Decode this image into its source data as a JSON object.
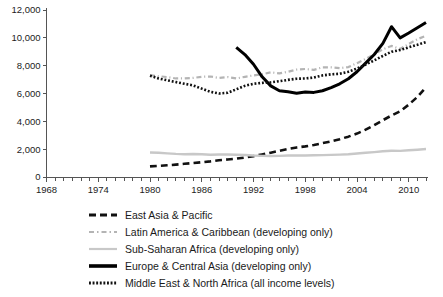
{
  "chart_data": {
    "type": "line",
    "title": "",
    "xlabel": "",
    "ylabel": "",
    "xlim": [
      1968,
      2012
    ],
    "ylim": [
      0,
      12000
    ],
    "grid": false,
    "legend_position": "bottom",
    "x_ticks": [
      1968,
      1974,
      1980,
      1986,
      1992,
      1998,
      2004,
      2010
    ],
    "x_minor_tick_interval": 1,
    "y_ticks": [
      0,
      2000,
      4000,
      6000,
      8000,
      10000,
      12000
    ],
    "y_tick_labels": [
      "0",
      "2,000",
      "4,000",
      "6,000",
      "8,000",
      "10,000",
      "12,000"
    ],
    "series": [
      {
        "name": "East Asia & Pacific",
        "style": "dashed",
        "color": "#111111",
        "width": 2.6,
        "x": [
          1980,
          1981,
          1982,
          1983,
          1984,
          1985,
          1986,
          1987,
          1988,
          1989,
          1990,
          1991,
          1992,
          1993,
          1994,
          1995,
          1996,
          1997,
          1998,
          1999,
          2000,
          2001,
          2002,
          2003,
          2004,
          2005,
          2006,
          2007,
          2008,
          2009,
          2010,
          2011,
          2012
        ],
        "values": [
          760,
          800,
          840,
          890,
          950,
          1000,
          1060,
          1120,
          1200,
          1260,
          1320,
          1400,
          1500,
          1620,
          1750,
          1880,
          2010,
          2120,
          2200,
          2300,
          2430,
          2560,
          2720,
          2900,
          3120,
          3400,
          3720,
          4080,
          4420,
          4720,
          5200,
          5750,
          6450
        ]
      },
      {
        "name": "Latin America & Caribbean (developing only)",
        "style": "dashdot",
        "color": "#b4b4b4",
        "width": 2.2,
        "x": [
          1980,
          1981,
          1982,
          1983,
          1984,
          1985,
          1986,
          1987,
          1988,
          1989,
          1990,
          1991,
          1992,
          1993,
          1994,
          1995,
          1996,
          1997,
          1998,
          1999,
          2000,
          2001,
          2002,
          2003,
          2004,
          2005,
          2006,
          2007,
          2008,
          2009,
          2010,
          2011,
          2012
        ],
        "values": [
          7320,
          7240,
          7180,
          7080,
          7080,
          7120,
          7200,
          7220,
          7120,
          7180,
          7080,
          7200,
          7300,
          7380,
          7520,
          7450,
          7560,
          7720,
          7760,
          7700,
          7880,
          7880,
          7820,
          7900,
          8180,
          8480,
          8820,
          9180,
          9420,
          9200,
          9560,
          9900,
          10150
        ]
      },
      {
        "name": "Sub-Saharan Africa (developing only)",
        "style": "solid",
        "color": "#c8c8c8",
        "width": 2.4,
        "x": [
          1980,
          1981,
          1982,
          1983,
          1984,
          1985,
          1986,
          1987,
          1988,
          1989,
          1990,
          1991,
          1992,
          1993,
          1994,
          1995,
          1996,
          1997,
          1998,
          1999,
          2000,
          2001,
          2002,
          2003,
          2004,
          2005,
          2006,
          2007,
          2008,
          2009,
          2010,
          2011,
          2012
        ],
        "values": [
          1760,
          1740,
          1700,
          1660,
          1640,
          1650,
          1630,
          1600,
          1620,
          1620,
          1600,
          1580,
          1540,
          1520,
          1510,
          1520,
          1540,
          1550,
          1550,
          1560,
          1570,
          1590,
          1610,
          1640,
          1690,
          1740,
          1790,
          1850,
          1890,
          1880,
          1920,
          1960,
          2010
        ]
      },
      {
        "name": "Europe & Central Asia (developing only)",
        "style": "solid",
        "color": "#000000",
        "width": 3.0,
        "x": [
          1990,
          1991,
          1992,
          1993,
          1994,
          1995,
          1996,
          1997,
          1998,
          1999,
          2000,
          2001,
          2002,
          2003,
          2004,
          2005,
          2006,
          2007,
          2008,
          2009,
          2010,
          2011,
          2012
        ],
        "values": [
          9320,
          8800,
          8100,
          7200,
          6550,
          6200,
          6120,
          6020,
          6100,
          6080,
          6200,
          6420,
          6700,
          7060,
          7560,
          8180,
          8800,
          9600,
          10800,
          10000,
          10350,
          10720,
          11100
        ]
      },
      {
        "name": "Middle East & North Africa (all income levels)",
        "style": "dotted",
        "color": "#111111",
        "width": 2.6,
        "x": [
          1980,
          1981,
          1982,
          1983,
          1984,
          1985,
          1986,
          1987,
          1988,
          1989,
          1990,
          1991,
          1992,
          1993,
          1994,
          1995,
          1996,
          1997,
          1998,
          1999,
          2000,
          2001,
          2002,
          2003,
          2004,
          2005,
          2006,
          2007,
          2008,
          2009,
          2010,
          2011,
          2012
        ],
        "values": [
          7280,
          7080,
          6950,
          6820,
          6700,
          6580,
          6350,
          6120,
          6000,
          6050,
          6300,
          6550,
          6700,
          6760,
          6800,
          6880,
          6980,
          7060,
          7080,
          7150,
          7300,
          7380,
          7420,
          7560,
          7800,
          8080,
          8380,
          8700,
          9000,
          9120,
          9320,
          9500,
          9700
        ]
      }
    ]
  },
  "legend": {
    "items": [
      {
        "label": "East Asia & Pacific",
        "style": "dashed",
        "color": "#111111"
      },
      {
        "label": "Latin America & Caribbean (developing only)",
        "style": "dashdot",
        "color": "#b4b4b4"
      },
      {
        "label": "Sub-Saharan Africa (developing only)",
        "style": "solid",
        "color": "#c8c8c8"
      },
      {
        "label": "Europe & Central Asia (developing only)",
        "style": "solid-bold",
        "color": "#000000"
      },
      {
        "label": "Middle East & North Africa (all income levels)",
        "style": "dotted",
        "color": "#111111"
      }
    ]
  }
}
